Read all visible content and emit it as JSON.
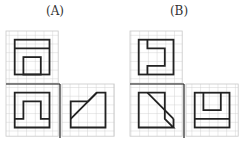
{
  "labels": {
    "a": "(A)",
    "b": "(B)"
  },
  "colors": {
    "grid": "#c8c8c8",
    "line": "#222222",
    "background": "#ffffff"
  },
  "cell_size": 8.7,
  "figures": [
    {
      "id": "A",
      "views": [
        "top-view",
        "front-view",
        "side-view"
      ]
    },
    {
      "id": "B",
      "views": [
        "top-view",
        "front-view",
        "side-view"
      ]
    }
  ]
}
